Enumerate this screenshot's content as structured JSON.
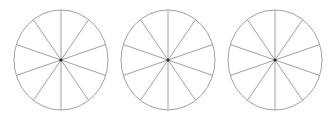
{
  "diagram": {
    "stroke_color": "#a0a0a0",
    "center_dot_color": "#222222",
    "background": "#ffffff",
    "circles": [
      {
        "cx": 61,
        "cy": 60,
        "rx": 47,
        "ry": 50,
        "sectors": 10
      },
      {
        "cx": 168,
        "cy": 60,
        "rx": 47,
        "ry": 50,
        "sectors": 10
      },
      {
        "cx": 275,
        "cy": 60,
        "rx": 47,
        "ry": 50,
        "sectors": 10
      }
    ]
  }
}
